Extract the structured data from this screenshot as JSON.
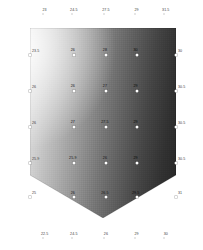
{
  "figure": {
    "type": "shaded-surface-plot",
    "shape": "pentagon",
    "background_color": "#ffffff",
    "gradient_light_color": "#f7f7f7",
    "gradient_dark_color": "#1f1f1f",
    "marker_color": "#ffffff"
  },
  "chart_data": {
    "type": "heatmap",
    "title": "",
    "subtitle": "",
    "xlabel": "",
    "ylabel": "",
    "grid": false,
    "legend": "none",
    "value_range": [
      22.5,
      31.5
    ],
    "top_axis": {
      "position": "top",
      "labels": [
        "23",
        "24.5",
        "27.5",
        "29",
        "31.5"
      ],
      "x_fractions": [
        0.1,
        0.3,
        0.52,
        0.73,
        0.93
      ]
    },
    "bottom_axis": {
      "position": "bottom",
      "labels": [
        "22.5",
        "24.5",
        "26",
        "29",
        "30"
      ],
      "x_fractions": [
        0.1,
        0.3,
        0.52,
        0.73,
        0.93
      ]
    },
    "left_axis": {
      "position": "left",
      "labels": [
        "23.5",
        "26",
        "26",
        "25.9",
        "25"
      ],
      "y_fractions": [
        0.14,
        0.33,
        0.52,
        0.71,
        0.89
      ]
    },
    "right_axis": {
      "position": "right",
      "labels": [
        "30",
        "30.5",
        "30.5",
        "30.5",
        "31"
      ],
      "y_fractions": [
        0.14,
        0.33,
        0.52,
        0.71,
        0.89
      ]
    },
    "points": [
      {
        "label": "26",
        "col": 1,
        "row": 1,
        "x": 0.3,
        "y": 0.14
      },
      {
        "label": "28",
        "col": 2,
        "row": 1,
        "x": 0.52,
        "y": 0.14
      },
      {
        "label": "30",
        "col": 3,
        "row": 1,
        "x": 0.73,
        "y": 0.14
      },
      {
        "label": "26",
        "col": 1,
        "row": 2,
        "x": 0.3,
        "y": 0.33
      },
      {
        "label": "27",
        "col": 2,
        "row": 2,
        "x": 0.52,
        "y": 0.33
      },
      {
        "label": "29",
        "col": 3,
        "row": 2,
        "x": 0.73,
        "y": 0.33
      },
      {
        "label": "27",
        "col": 1,
        "row": 3,
        "x": 0.3,
        "y": 0.52
      },
      {
        "label": "27.5",
        "col": 2,
        "row": 3,
        "x": 0.52,
        "y": 0.52
      },
      {
        "label": "29",
        "col": 3,
        "row": 3,
        "x": 0.73,
        "y": 0.52
      },
      {
        "label": "25.9",
        "col": 1,
        "row": 4,
        "x": 0.3,
        "y": 0.71
      },
      {
        "label": "26",
        "col": 2,
        "row": 4,
        "x": 0.52,
        "y": 0.71
      },
      {
        "label": "29",
        "col": 3,
        "row": 4,
        "x": 0.73,
        "y": 0.71
      },
      {
        "label": "26",
        "col": 1,
        "row": 5,
        "x": 0.3,
        "y": 0.89
      },
      {
        "label": "26.5",
        "col": 2,
        "row": 5,
        "x": 0.52,
        "y": 0.89
      },
      {
        "label": "29.5",
        "col": 3,
        "row": 5,
        "x": 0.73,
        "y": 0.89
      }
    ],
    "edge_points": [
      {
        "label": "23.5",
        "side": "left",
        "x": 0.0,
        "y": 0.14
      },
      {
        "label": "26",
        "side": "left",
        "x": 0.0,
        "y": 0.33
      },
      {
        "label": "26",
        "side": "left",
        "x": 0.0,
        "y": 0.52
      },
      {
        "label": "25.9",
        "side": "left",
        "x": 0.0,
        "y": 0.71
      },
      {
        "label": "25",
        "side": "left",
        "x": 0.0,
        "y": 0.89
      },
      {
        "label": "30",
        "side": "right",
        "x": 1.0,
        "y": 0.14
      },
      {
        "label": "30.5",
        "side": "right",
        "x": 1.0,
        "y": 0.33
      },
      {
        "label": "30.5",
        "side": "right",
        "x": 1.0,
        "y": 0.52
      },
      {
        "label": "30.5",
        "side": "right",
        "x": 1.0,
        "y": 0.71
      },
      {
        "label": "31",
        "side": "right",
        "x": 1.0,
        "y": 0.89
      }
    ]
  },
  "caption": {
    "line_one": "",
    "line_two": ""
  }
}
